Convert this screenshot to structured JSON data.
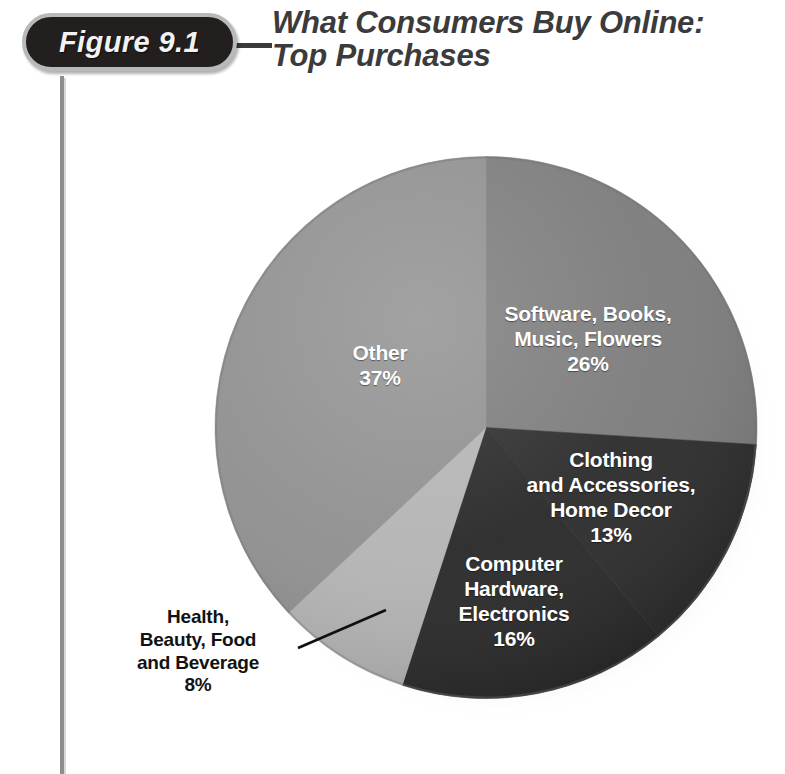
{
  "figure": {
    "badge_label": "Figure 9.1",
    "title_line_1": "What Consumers Buy Online:",
    "title_line_2": "Top Purchases"
  },
  "colors": {
    "badge_fill": "#231f1e",
    "badge_border": "#b9b9b9",
    "badge_text": "#f2f2f2",
    "title_text": "#3b3b3b",
    "rule": "#8d8d8d",
    "slice_software": "#7b7b7b",
    "slice_clothing": "#2a2a2a",
    "slice_computer": "#272727",
    "slice_health": "#b3b3b3",
    "slice_other": "#8f8f8f",
    "label_light": "#ffffff",
    "label_dark": "#121212"
  },
  "labels": {
    "software": {
      "line1": "Software, Books,",
      "line2": "Music, Flowers",
      "value": "26%"
    },
    "clothing": {
      "line1": "Clothing",
      "line2": "and Accessories,",
      "line3": "Home Decor",
      "value": "13%"
    },
    "computer": {
      "line1": "Computer",
      "line2": "Hardware,",
      "line3": "Electronics",
      "value": "16%"
    },
    "health": {
      "line1": "Health,",
      "line2": "Beauty, Food",
      "line3": "and Beverage",
      "value": "8%"
    },
    "other": {
      "line1": "Other",
      "value": "37%"
    }
  },
  "chart_data": {
    "type": "pie",
    "title": "What Consumers Buy Online: Top Purchases",
    "xlabel": "",
    "ylabel": "",
    "grid": false,
    "legend": "none (slices labeled in place)",
    "start_angle_deg": 0,
    "direction": "clockwise",
    "units": "percent",
    "categories": [
      "Software, Books, Music, Flowers",
      "Clothing and Accessories, Home Decor",
      "Computer Hardware, Electronics",
      "Health, Beauty, Food and Beverage",
      "Other"
    ],
    "values": [
      26,
      13,
      16,
      8,
      37
    ],
    "labels_shown": [
      "26%",
      "13%",
      "16%",
      "8%",
      "37%"
    ],
    "slice_colors": [
      "#7b7b7b",
      "#2a2a2a",
      "#272727",
      "#b3b3b3",
      "#8f8f8f"
    ],
    "label_placement": [
      "inside",
      "inside",
      "inside",
      "outside-with-leader",
      "inside"
    ],
    "total": 100
  }
}
